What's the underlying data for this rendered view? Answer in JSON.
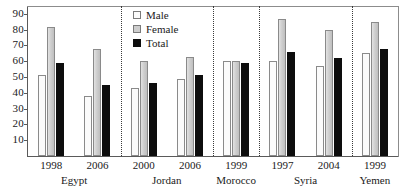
{
  "chart_data": {
    "type": "bar",
    "title": "",
    "subtitle": "",
    "xlabel": "",
    "ylabel": "",
    "ylim": [
      0,
      95
    ],
    "grid": false,
    "legend_position": "top-center-right",
    "categories": [
      "Egypt 1998",
      "Egypt 2006",
      "Jordan 2000",
      "Jordan 2006",
      "Morocco 1999",
      "Syria 1997",
      "Syria 2004",
      "Yemen 1999"
    ],
    "groups": [
      {
        "country": "Egypt",
        "year": "1998"
      },
      {
        "country": "Egypt",
        "year": "2006"
      },
      {
        "country": "Jordan",
        "year": "2000"
      },
      {
        "country": "Jordan",
        "year": "2006"
      },
      {
        "country": "Morocco",
        "year": "1999"
      },
      {
        "country": "Syria",
        "year": "1997"
      },
      {
        "country": "Syria",
        "year": "2004"
      },
      {
        "country": "Yemen",
        "year": "1999"
      }
    ],
    "series": [
      {
        "name": "Male",
        "color": "#fbfbfb",
        "values": [
          51,
          38,
          43,
          49,
          60,
          60,
          57,
          65
        ]
      },
      {
        "name": "Female",
        "color": "#cdcdcd",
        "values": [
          82,
          68,
          60,
          63,
          60,
          87,
          80,
          85
        ]
      },
      {
        "name": "Total",
        "color": "#0d0d0d",
        "values": [
          59,
          45,
          46,
          51,
          59,
          66,
          62,
          68
        ]
      }
    ],
    "yticks": [
      10,
      20,
      30,
      40,
      50,
      60,
      70,
      80,
      90
    ],
    "ytick_labels": [
      "10",
      "20",
      "30",
      "40",
      "50",
      "60",
      "70",
      "80",
      "90"
    ],
    "country_separators": [
      "Egypt|Jordan",
      "Jordan|Morocco",
      "Morocco|Syria",
      "Syria|Yemen"
    ]
  },
  "axes": {
    "y_tick_labels": [
      "90",
      "80",
      "70",
      "60",
      "50",
      "40",
      "30",
      "20",
      "10"
    ],
    "year_labels": [
      "1998",
      "2006",
      "2000",
      "2006",
      "1999",
      "1997",
      "2004",
      "1999"
    ],
    "country_labels": [
      "Egypt",
      "Jordan",
      "Morocco",
      "Syria",
      "Yemen"
    ]
  },
  "legend": {
    "items": [
      {
        "label": "Male",
        "swatch": "male-swatch-icon"
      },
      {
        "label": "Female",
        "swatch": "female-swatch-icon"
      },
      {
        "label": "Total",
        "swatch": "total-swatch-icon"
      }
    ]
  }
}
